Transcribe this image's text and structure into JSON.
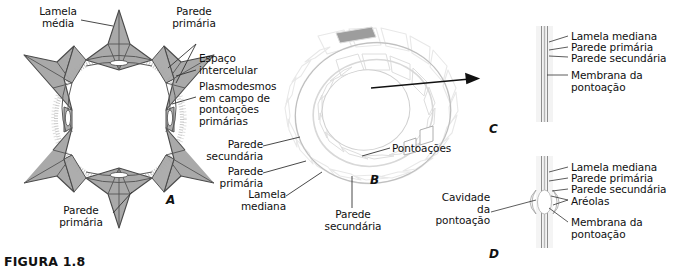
{
  "figure": {
    "caption": "FIGURA 1.8",
    "panels": [
      {
        "id": "A",
        "letter": "A",
        "description": "corte transversal de celula com espacos intercelulares"
      },
      {
        "id": "B",
        "letter": "B",
        "description": "elemento de vaso tridimensional com pontoacoes"
      },
      {
        "id": "C",
        "letter": "C",
        "description": "pontoacao simples em corte"
      },
      {
        "id": "D",
        "letter": "D",
        "description": "pontoacao areolada em corte"
      }
    ]
  },
  "panel_a": {
    "letter": "A",
    "labels": {
      "lamela_media": "Lamela\nmédia",
      "parede_primaria_top": "Parede\nprimária",
      "espaco_intercelular": "Espaço\nintercelular",
      "plasmodesmos": "Plasmodesmos\nem campo de\npontoações\nprimárias",
      "parede_primaria_bottom": "Parede\nprimária"
    }
  },
  "panel_b": {
    "letter": "B",
    "labels": {
      "parede_secundaria_left": "Parede\nsecundária",
      "parede_primaria": "Parede\nprimária",
      "lamela_mediana": "Lamela\nmediana",
      "parede_secundaria_bottom": "Parede\nsecundária",
      "pontoacoes": "Pontoações"
    }
  },
  "panel_c": {
    "letter": "C",
    "labels": {
      "lamela_mediana": "Lamela mediana",
      "parede_primaria": "Parede primária",
      "parede_secundaria": "Parede secundária",
      "membrana_pontoacao": "Membrana da\npontoação"
    }
  },
  "panel_d": {
    "letter": "D",
    "labels": {
      "lamela_mediana": "Lamela mediana",
      "parede_primaria": "Parede primária",
      "parede_secundaria": "Parede secundária",
      "areolas": "Aréolas",
      "membrana_pontoacao": "Membrana da\npontoação",
      "cavidade_pontoacao": "Cavidade\nda\npontoação"
    }
  },
  "colors": {
    "wall_gray": "#a9a9a9",
    "block_dark": "#6b6b6b",
    "block_mid": "#8a8a8a",
    "outline": "#3c3c3c",
    "text": "#101010",
    "background": "#ffffff"
  }
}
